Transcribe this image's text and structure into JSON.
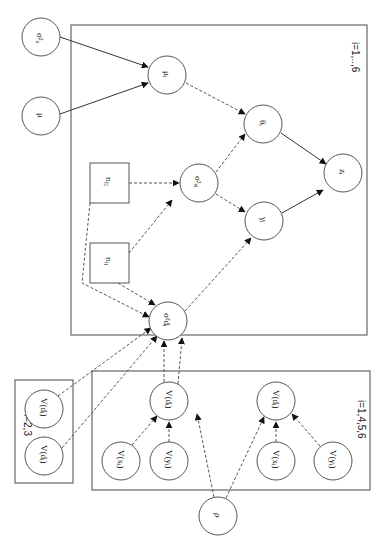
{
  "diagram": {
    "type": "graphical-model (plate notation), rotated 90° clockwise",
    "plates": [
      {
        "id": "plate-main",
        "label": "i=1,..,6"
      },
      {
        "id": "plate-23",
        "label": "i=2,3"
      },
      {
        "id": "plate-1456",
        "label": "i=1,4,5,6"
      }
    ],
    "nodes": {
      "sigma2_a": {
        "label": "σ²ₐ",
        "shape": "circle"
      },
      "mu": {
        "label": "μ",
        "shape": "circle"
      },
      "mu_i": {
        "label": "μᵢ",
        "shape": "circle"
      },
      "theta_i": {
        "label": "θᵢ",
        "shape": "circle"
      },
      "z_i": {
        "label": "zᵢ",
        "shape": "circle"
      },
      "n_i2": {
        "label": "nᵢ₂",
        "shape": "square"
      },
      "n_i1": {
        "label": "nᵢ₁",
        "shape": "square"
      },
      "sigma2_ei": {
        "label": "σ²ₑᵢ",
        "shape": "circle"
      },
      "gamma_i": {
        "label": "γᵢ",
        "shape": "circle"
      },
      "sigma2_di": {
        "label": "σ²dᵢ",
        "shape": "circle"
      },
      "V_d_23a": {
        "label": "V(dᵢ)",
        "shape": "circle"
      },
      "V_d_23b": {
        "label": "V(dᵢ)",
        "shape": "circle"
      },
      "V_d_left": {
        "label": "V(dᵢ)",
        "shape": "circle"
      },
      "V_x_left": {
        "label": "V(xᵢ)",
        "shape": "circle"
      },
      "V_y_left": {
        "label": "V(yᵢ)",
        "shape": "circle"
      },
      "V_d_right": {
        "label": "V(dᵢ)",
        "shape": "circle"
      },
      "V_x_right": {
        "label": "V(xᵢ)",
        "shape": "circle"
      },
      "V_y_right": {
        "label": "V(yᵢ)",
        "shape": "circle"
      },
      "rho": {
        "label": "ρ",
        "shape": "circle"
      }
    },
    "edges": [
      {
        "from": "sigma2_a",
        "to": "mu_i",
        "style": "solid"
      },
      {
        "from": "mu",
        "to": "mu_i",
        "style": "solid"
      },
      {
        "from": "mu_i",
        "to": "theta_i",
        "style": "dashed"
      },
      {
        "from": "theta_i",
        "to": "z_i",
        "style": "solid"
      },
      {
        "from": "gamma_i",
        "to": "z_i",
        "style": "solid"
      },
      {
        "from": "n_i2",
        "to": "sigma2_ei",
        "style": "dashed"
      },
      {
        "from": "n_i1",
        "to": "sigma2_ei",
        "style": "dashed"
      },
      {
        "from": "sigma2_ei",
        "to": "theta_i",
        "style": "dashed"
      },
      {
        "from": "sigma2_ei",
        "to": "gamma_i",
        "style": "dashed"
      },
      {
        "from": "n_i1",
        "to": "sigma2_di",
        "style": "dashed"
      },
      {
        "from": "n_i2",
        "to": "sigma2_di",
        "style": "dashed"
      },
      {
        "from": "sigma2_di",
        "to": "gamma_i",
        "style": "dashed"
      },
      {
        "from": "V_d_23a",
        "to": "sigma2_di",
        "style": "dashed"
      },
      {
        "from": "V_d_23b",
        "to": "sigma2_di",
        "style": "dashed"
      },
      {
        "from": "V_d_left",
        "to": "sigma2_di",
        "style": "dashed"
      },
      {
        "from": "V_d_left",
        "to": "sigma2_di",
        "style": "dashed"
      },
      {
        "from": "V_x_left",
        "to": "V_d_left",
        "style": "dashed"
      },
      {
        "from": "V_y_left",
        "to": "V_d_left",
        "style": "dashed"
      },
      {
        "from": "V_x_right",
        "to": "V_d_right",
        "style": "dashed"
      },
      {
        "from": "V_y_right",
        "to": "V_d_right",
        "style": "dashed"
      },
      {
        "from": "rho",
        "to": "V_d_left",
        "style": "dashed"
      },
      {
        "from": "rho",
        "to": "V_d_right",
        "style": "dashed"
      }
    ]
  }
}
